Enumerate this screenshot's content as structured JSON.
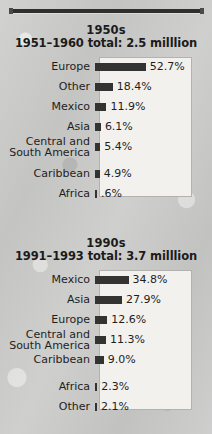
{
  "figure": {
    "background_color": "#c8c8c6",
    "panel_color": "#f2f1ee",
    "bar_color": "#333332",
    "text_color": "#1e1e1e"
  },
  "chart_data": [
    {
      "id": "chart-1950s",
      "type": "bar",
      "orientation": "horizontal",
      "title": "1950s",
      "subtitle": "1951–1960 total: 2.5 milllion",
      "xlabel": "",
      "ylabel": "",
      "xlim": [
        0,
        55
      ],
      "grid": false,
      "legend": false,
      "value_suffix": "%",
      "categories": [
        "Europe",
        "Other",
        "Mexico",
        "Asia",
        "Central and\nSouth America",
        "Caribbean",
        "Africa"
      ],
      "values": [
        52.7,
        18.4,
        11.9,
        6.1,
        5.4,
        4.9,
        0.6
      ],
      "value_labels": [
        "52.7%",
        "18.4%",
        "11.9%",
        "6.1%",
        "5.4%",
        "4.9%",
        ".6%"
      ]
    },
    {
      "id": "chart-1990s",
      "type": "bar",
      "orientation": "horizontal",
      "title": "1990s",
      "subtitle": "1991–1993 total: 3.7 milllion",
      "xlabel": "",
      "ylabel": "",
      "xlim": [
        0,
        55
      ],
      "grid": false,
      "legend": false,
      "value_suffix": "%",
      "categories": [
        "Mexico",
        "Asia",
        "Europe",
        "Central and\nSouth America",
        "Caribbean",
        "Africa",
        "Other"
      ],
      "values": [
        34.8,
        27.9,
        12.6,
        11.3,
        9.0,
        2.3,
        2.1
      ],
      "value_labels": [
        "34.8%",
        "27.9%",
        "12.6%",
        "11.3%",
        "9.0%",
        "2.3%",
        "2.1%"
      ]
    }
  ]
}
